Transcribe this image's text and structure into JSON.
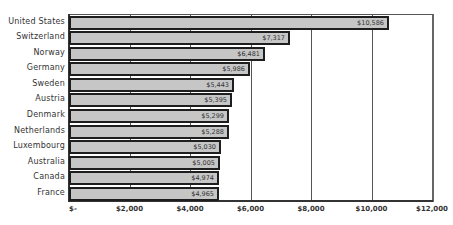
{
  "chart_data": {
    "type": "bar",
    "orientation": "horizontal",
    "title": "",
    "xlabel": "",
    "ylabel": "",
    "categories": [
      "United States",
      "Switzerland",
      "Norway",
      "Germany",
      "Sweden",
      "Austria",
      "Denmark",
      "Netherlands",
      "Luxembourg",
      "Australia",
      "Canada",
      "France"
    ],
    "values": [
      10586,
      7317,
      6481,
      5986,
      5443,
      5395,
      5299,
      5288,
      5030,
      5005,
      4974,
      4965
    ],
    "value_labels": [
      "$10,586",
      "$7,317",
      "$6,481",
      "$5,986",
      "$5,443",
      "$5,395",
      "$5,299",
      "$5,288",
      "$5,030",
      "$5,005",
      "$4,974",
      "$4,965"
    ],
    "xlim": [
      0,
      12000
    ],
    "x_ticks": [
      0,
      2000,
      4000,
      6000,
      8000,
      10000,
      12000
    ],
    "x_tick_labels": [
      "$-",
      "$2,000",
      "$4,000",
      "$6,000",
      "$8,000",
      "$10,000",
      "$12,000"
    ],
    "grid": "vertical",
    "legend": null,
    "colors": {
      "bar_fill": "#c6c6c6",
      "bar_border": "#1e1e1e",
      "grid": "#555555"
    }
  }
}
